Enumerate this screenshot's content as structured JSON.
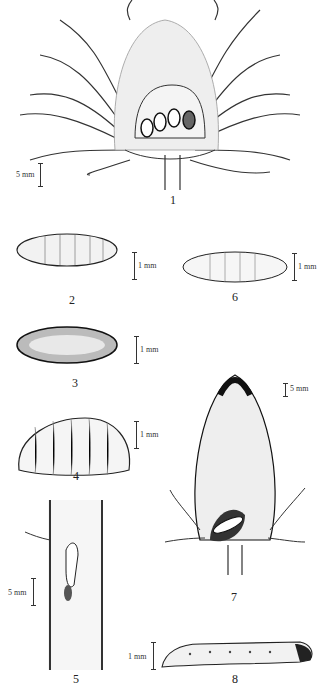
{
  "plate": {
    "figures": [
      {
        "number": "1",
        "subject": "flower head section with larvae",
        "scale": "5 mm"
      },
      {
        "number": "2",
        "subject": "puparium dorsal view",
        "scale": "1 mm"
      },
      {
        "number": "3",
        "subject": "puparium",
        "scale": "1 mm"
      },
      {
        "number": "4",
        "subject": "larva lateral view",
        "scale": "1 mm"
      },
      {
        "number": "5",
        "subject": "stem gall section",
        "scale": "5 mm"
      },
      {
        "number": "6",
        "subject": "larva",
        "scale": "1 mm"
      },
      {
        "number": "7",
        "subject": "flower bud with damage",
        "scale": "5 mm"
      },
      {
        "number": "8",
        "subject": "caterpillar lateral view",
        "scale": "1 mm"
      }
    ]
  },
  "colors": {
    "ink": "#222222",
    "paper": "#ffffff",
    "stipple": "#9a9a9a"
  }
}
